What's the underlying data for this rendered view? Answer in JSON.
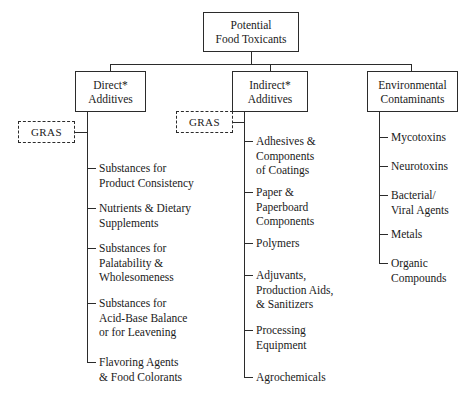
{
  "diagram": {
    "title": "Potential Food Toxicants",
    "root": {
      "line1": "Potential",
      "line2": "Food Toxicants"
    },
    "branches": [
      {
        "id": "direct-additives",
        "line1": "Direct*",
        "line2": "Additives",
        "gras_label": "GRAS",
        "leaves": [
          "Substances for\nProduct Consistency",
          "Nutrients & Dietary\nSupplements",
          "Substances for\nPalatability &\nWholesomeness",
          "Substances for\nAcid-Base Balance\nor for Leavening",
          "Flavoring Agents\n& Food Colorants"
        ]
      },
      {
        "id": "indirect-additives",
        "line1": "Indirect*",
        "line2": "Additives",
        "gras_label": "GRAS",
        "leaves": [
          "Adhesives &\nComponents\nof Coatings",
          "Paper &\nPaperboard\nComponents",
          "Polymers",
          "Adjuvants,\nProduction Aids,\n& Sanitizers",
          "Processing\nEquipment",
          "Agrochemicals"
        ]
      },
      {
        "id": "environmental-contaminants",
        "line1": "Environmental",
        "line2": "Contaminants",
        "gras_label": null,
        "leaves": [
          "Mycotoxins",
          "Neurotoxins",
          "Bacterial/\nViral Agents",
          "Metals",
          "Organic\nCompounds"
        ]
      }
    ],
    "colors": {
      "background": "#ffffff",
      "stroke": "#2b2b2b",
      "text": "#1a1a1a"
    }
  }
}
